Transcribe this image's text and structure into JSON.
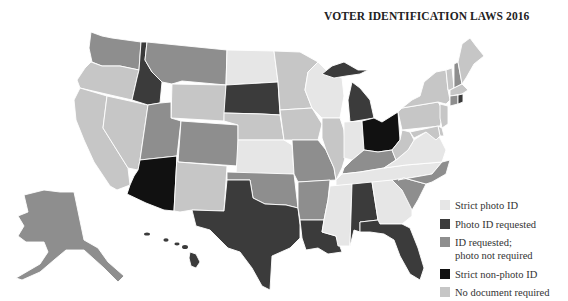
{
  "title": "VOTER IDENTIFICATION LAWS 2016",
  "categories": {
    "strict_photo": {
      "label": "Strict photo ID",
      "color": "#e6e6e6"
    },
    "photo_requested": {
      "label": "Photo ID requested",
      "color": "#3b3b3b"
    },
    "id_requested": {
      "label": "ID requested; photo not required",
      "label_lines": [
        "ID requested;",
        "photo not required"
      ],
      "color": "#8e8e8e"
    },
    "strict_nonphoto": {
      "label": "Strict non-photo ID",
      "color": "#111111"
    },
    "no_document": {
      "label": "No document required",
      "color": "#c6c6c6"
    }
  },
  "legend": [
    {
      "key": "strict_photo",
      "label": "Strict photo ID"
    },
    {
      "key": "photo_requested",
      "label": "Photo ID requested"
    },
    {
      "key": "id_requested",
      "label": "ID requested;",
      "label2": "photo not required"
    },
    {
      "key": "strict_nonphoto",
      "label": "Strict non-photo ID"
    },
    {
      "key": "no_document",
      "label": "No document required"
    }
  ],
  "states": {
    "WA": "id_requested",
    "OR": "no_document",
    "CA": "no_document",
    "NV": "no_document",
    "ID": "photo_requested",
    "MT": "id_requested",
    "WY": "no_document",
    "UT": "id_requested",
    "AZ": "strict_nonphoto",
    "CO": "id_requested",
    "NM": "no_document",
    "ND": "strict_photo",
    "SD": "photo_requested",
    "NE": "no_document",
    "KS": "strict_photo",
    "OK": "id_requested",
    "TX": "photo_requested",
    "MN": "no_document",
    "IA": "no_document",
    "MO": "id_requested",
    "AR": "id_requested",
    "LA": "photo_requested",
    "WI": "strict_photo",
    "IL": "no_document",
    "MI": "photo_requested",
    "IN": "strict_photo",
    "OH": "strict_nonphoto",
    "KY": "id_requested",
    "TN": "strict_photo",
    "MS": "strict_photo",
    "AL": "photo_requested",
    "GA": "strict_photo",
    "FL": "photo_requested",
    "SC": "id_requested",
    "NC": "id_requested",
    "VA": "strict_photo",
    "WV": "no_document",
    "PA": "no_document",
    "NY": "no_document",
    "VT": "no_document",
    "NH": "id_requested",
    "ME": "no_document",
    "MA": "no_document",
    "RI": "photo_requested",
    "CT": "id_requested",
    "NJ": "no_document",
    "DE": "no_document",
    "MD": "no_document",
    "AK": "id_requested",
    "HI": "photo_requested"
  }
}
